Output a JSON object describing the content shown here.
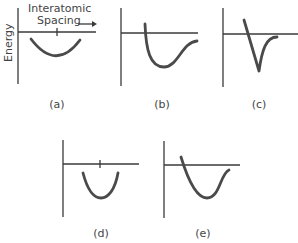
{
  "header": {
    "x_axis_label_line1": "Interatomic",
    "x_axis_label_line2": "Spacing",
    "y_axis_label": "Energy",
    "arrow_icon": "right-arrow-icon"
  },
  "panels": [
    {
      "id": "a",
      "caption": "(a)",
      "shape": "shallow symmetric well with tick mark at minimum"
    },
    {
      "id": "b",
      "caption": "(b)",
      "shape": "asymmetric potential well (Lennard-Jones-like)"
    },
    {
      "id": "c",
      "caption": "(c)",
      "shape": "narrow deep asymmetric well"
    },
    {
      "id": "d",
      "caption": "(d)",
      "shape": "symmetric parabolic well with tick mark at minimum"
    },
    {
      "id": "e",
      "caption": "(e)",
      "shape": "broad asymmetric well"
    }
  ],
  "colors": {
    "axis": "#3a3a3a",
    "curve": "#4a4a4a",
    "text": "#444444",
    "background": "#ffffff"
  }
}
